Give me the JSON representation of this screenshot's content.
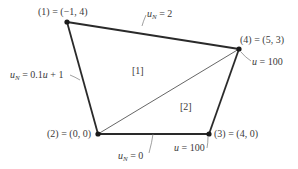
{
  "diagram": {
    "type": "finite-element-mesh",
    "colors": {
      "edge": "#2a2a2a",
      "diagonal": "#555555",
      "leader": "#777777",
      "node": "#1a1a1a",
      "text": "#3a3a3a"
    },
    "nodes": [
      {
        "id": 1,
        "label": "(1) = (−1, 4)",
        "coords": [
          -1,
          4
        ],
        "px": [
          67,
          22
        ]
      },
      {
        "id": 2,
        "label": "(2) = (0, 0)",
        "coords": [
          0,
          0
        ],
        "px": [
          98,
          134
        ]
      },
      {
        "id": 3,
        "label": "(3) = (4, 0)",
        "coords": [
          4,
          0
        ],
        "px": [
          209,
          134
        ]
      },
      {
        "id": 4,
        "label": "(4) = (5, 3)",
        "coords": [
          5,
          3
        ],
        "px": [
          239,
          49
        ]
      }
    ],
    "elements": [
      {
        "id": 1,
        "label": "[1]",
        "nodes": [
          1,
          2,
          4
        ]
      },
      {
        "id": 2,
        "label": "[2]",
        "nodes": [
          2,
          3,
          4
        ]
      }
    ],
    "boundary_conditions": [
      {
        "edge": "1-4",
        "var": "u",
        "sub": "N",
        "rhs": " = 2"
      },
      {
        "edge": "1-2",
        "var": "u",
        "sub": "N",
        "rhs": " = 0.1u + 1"
      },
      {
        "edge": "2-3",
        "var": "u",
        "sub": "N",
        "rhs": " = 0"
      },
      {
        "node": 4,
        "var": "u",
        "sub": "",
        "rhs": " = 100"
      },
      {
        "node": 3,
        "var": "u",
        "sub": "",
        "rhs": " = 100"
      }
    ],
    "labels": {
      "node1": "(1) = (−1, 4)",
      "node2": "(2) = (0, 0)",
      "node3": "(3) = (4, 0)",
      "node4": "(4) = (5, 3)",
      "elem1": "[1]",
      "elem2": "[2]",
      "bc_top_var": "u",
      "bc_top_sub": "N",
      "bc_top_rhs": " = 2",
      "bc_left_var": "u",
      "bc_left_sub": "N",
      "bc_left_rhs": " = 0.1",
      "bc_left_var2": "u",
      "bc_left_rhs2": " + 1",
      "bc_bottom_var": "u",
      "bc_bottom_sub": "N",
      "bc_bottom_rhs": " = 0",
      "bc_node4_var": "u",
      "bc_node4_rhs": " = 100",
      "bc_node3_var": "u",
      "bc_node3_rhs": " = 100"
    }
  }
}
